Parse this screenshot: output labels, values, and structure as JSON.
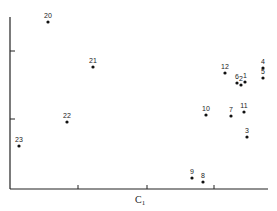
{
  "chart_data": {
    "type": "scatter",
    "title": "",
    "xlabel": "C1",
    "ylabel": "",
    "grid": false,
    "legend": null,
    "x_ticks": [
      "",
      "",
      ""
    ],
    "y_ticks": [
      "",
      ""
    ],
    "points": [
      {
        "label": "1",
        "px": 245,
        "py": 82
      },
      {
        "label": "2",
        "px": 241,
        "py": 85
      },
      {
        "label": "3",
        "px": 247,
        "py": 137
      },
      {
        "label": "4",
        "px": 263,
        "py": 68
      },
      {
        "label": "5",
        "px": 263,
        "py": 78
      },
      {
        "label": "6",
        "px": 237,
        "py": 83
      },
      {
        "label": "7",
        "px": 231,
        "py": 116
      },
      {
        "label": "8",
        "px": 203,
        "py": 182
      },
      {
        "label": "9",
        "px": 192,
        "py": 178
      },
      {
        "label": "10",
        "px": 206,
        "py": 115
      },
      {
        "label": "11",
        "px": 244,
        "py": 112
      },
      {
        "label": "12",
        "px": 225,
        "py": 73
      },
      {
        "label": "20",
        "px": 48,
        "py": 22
      },
      {
        "label": "21",
        "px": 93,
        "py": 67
      },
      {
        "label": "22",
        "px": 67,
        "py": 122
      },
      {
        "label": "23",
        "px": 19,
        "py": 146
      }
    ]
  },
  "axes": {
    "x_label_main": "C",
    "x_label_sub": "1"
  }
}
